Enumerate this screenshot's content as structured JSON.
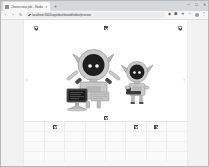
{
  "window": {
    "controls": [
      {
        "name": "minimize-button",
        "glyph": "─"
      },
      {
        "name": "maximize-button",
        "glyph": "□"
      },
      {
        "name": "close-button",
        "glyph": "✕"
      }
    ]
  },
  "tabs": {
    "items": [
      {
        "title": "Chores new job - Studio",
        "favicon": "page-favicon",
        "close_glyph": "✕"
      }
    ],
    "new_tab_glyph": "+"
  },
  "navbar": {
    "back_glyph": "‹",
    "forward_glyph": "›",
    "reload_glyph": "↻",
    "url": "localhost:3000/app/dashboard/editor/preview",
    "lock_icon": "lock-icon",
    "extensions": [
      {
        "name": "extension-icon-1",
        "glyph": "◆"
      },
      {
        "name": "extension-icon-2",
        "glyph": "⬢"
      },
      {
        "name": "extension-icon-3",
        "glyph": "★"
      },
      {
        "name": "bookmark-star-icon",
        "glyph": "☆"
      },
      {
        "name": "menu-kebab-icon",
        "glyph": "⋮"
      }
    ]
  },
  "page": {
    "toolbar_items": [
      {
        "name": "broken-image-placeholder-left",
        "style": "outline",
        "left_pct": 12
      },
      {
        "name": "broken-image-placeholder-center",
        "style": "solid",
        "left_pct": 53
      },
      {
        "name": "broken-image-placeholder-right",
        "style": "outline",
        "left_pct": 96
      }
    ],
    "hero": {
      "prev_arrow_glyph": "‹",
      "next_arrow_glyph": "›",
      "caption_placeholder": "broken-image-placeholder-caption",
      "figures": [
        {
          "name": "large-robot-figure",
          "description": "Large grey robot with round dark face, two eyes, pointed horn ears, raised arms and a desktop computer on a stand",
          "body_color": "#c9c9c9",
          "face_color": "#1e1e1e",
          "eye_color": "#ffffff",
          "accent_color": "#4a4a4a"
        },
        {
          "name": "small-robot-figure",
          "description": "Small grey robot with round dark face, two eyes, pointed horn ears, holding a dark bar",
          "body_color": "#c9c9c9",
          "face_color": "#1e1e1e",
          "eye_color": "#ffffff",
          "accent_color": "#4a4a4a"
        }
      ]
    },
    "grid": {
      "rows": [
        {
          "cells": [
            {
              "type": "empty",
              "value": ""
            },
            {
              "type": "icon",
              "value": "broken-image-placeholder",
              "style": "solid"
            },
            {
              "type": "empty",
              "value": ""
            },
            {
              "type": "empty",
              "value": ""
            },
            {
              "type": "empty",
              "value": ""
            },
            {
              "type": "icon",
              "value": "broken-image-placeholder",
              "style": "solid"
            },
            {
              "type": "icon",
              "value": "broken-image-placeholder",
              "style": "solid"
            },
            {
              "type": "empty",
              "value": ""
            }
          ]
        },
        {
          "cells": [
            {
              "type": "empty",
              "value": ""
            },
            {
              "type": "empty",
              "value": ""
            },
            {
              "type": "empty",
              "value": ""
            },
            {
              "type": "empty",
              "value": ""
            },
            {
              "type": "empty",
              "value": ""
            },
            {
              "type": "empty",
              "value": ""
            },
            {
              "type": "empty",
              "value": ""
            },
            {
              "type": "empty",
              "value": ""
            }
          ]
        },
        {
          "cells": [
            {
              "type": "empty",
              "value": ""
            },
            {
              "type": "empty",
              "value": ""
            },
            {
              "type": "empty",
              "value": ""
            },
            {
              "type": "empty",
              "value": ""
            },
            {
              "type": "empty",
              "value": ""
            },
            {
              "type": "empty",
              "value": ""
            },
            {
              "type": "empty",
              "value": ""
            },
            {
              "type": "empty",
              "value": ""
            }
          ]
        },
        {
          "cells": [
            {
              "type": "empty",
              "value": ""
            },
            {
              "type": "empty",
              "value": ""
            },
            {
              "type": "empty",
              "value": ""
            },
            {
              "type": "empty",
              "value": ""
            },
            {
              "type": "empty",
              "value": ""
            },
            {
              "type": "empty",
              "value": ""
            },
            {
              "type": "empty",
              "value": ""
            },
            {
              "type": "empty",
              "value": ""
            }
          ]
        }
      ]
    }
  },
  "colors": {
    "chrome_tabstrip": "#d6d9dc",
    "chrome_toolbar": "#f7f7f8",
    "omnibox": "#ececed",
    "page_bg": "#ffffff",
    "gutter": "#f2f2f2",
    "grid_bg": "#fafafa",
    "window_border": "#b8b8b8"
  }
}
